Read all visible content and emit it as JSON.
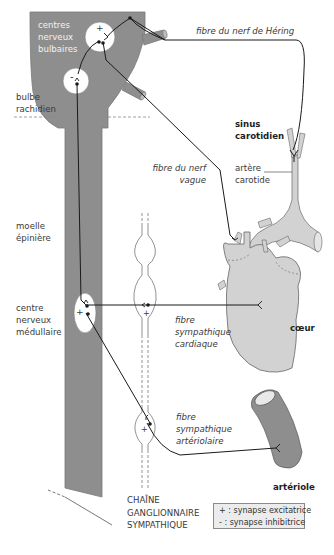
{
  "labels": {
    "centres_bulbaires": "centres\nnerveux\nbulbaires",
    "bulbe_rachidien": "bulbe\nrachidien",
    "moelle_epiniere": "moelle\népinière",
    "centre_medullaire": "centre\nnerveux\nmédullaire",
    "fibre_hering": "fibre du nerf de Héring",
    "sinus_carotidien": "sinus\ncarotidien",
    "artere_carotide": "artère\ncarotide",
    "fibre_vague": "fibre du nerf\nvague",
    "fibre_cardiaque": "fibre\nsympathique\ncardiaque",
    "coeur": "cœur",
    "fibre_arteriolaire": "fibre\nsympathique\nartériolaire",
    "arteriole": "artériole",
    "chaine": "CHAÎNE\nGANGLIONNAIRE\nSYMPATHIQUE"
  },
  "synapse_signs": {
    "bulbar_top": "+",
    "bulbar_bottom": "-",
    "medullary": "+",
    "ganglion_cardiac": "+",
    "ganglion_arteriolar": "+"
  },
  "legend": {
    "excitatory": "+ : synapse excitatrice",
    "inhibitory": "-  : synapse inhibitrice"
  },
  "colors": {
    "nervous_tissue": "#8e8e8e",
    "organ_fill": "#d2d2d2",
    "nerve_line": "#1a1a1a",
    "legend_bg": "#ececec"
  }
}
